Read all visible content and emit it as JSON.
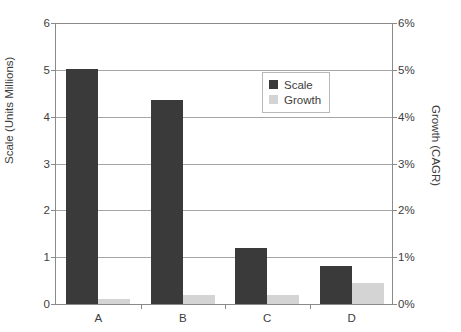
{
  "chart_data": {
    "type": "bar",
    "title": "",
    "subtitle": "",
    "xlabel": "",
    "ylabel": "Scale (Units Millions)",
    "y2label": "Growth (CAGR)",
    "categories": [
      "A",
      "B",
      "C",
      "D"
    ],
    "series": [
      {
        "name": "Scale",
        "axis": "left",
        "color": "#3a3a3a",
        "values": [
          5.0,
          4.35,
          1.2,
          0.8
        ]
      },
      {
        "name": "Growth",
        "axis": "right",
        "color": "#d4d4d4",
        "values": [
          0.1,
          0.2,
          0.2,
          0.45
        ]
      }
    ],
    "ylim": [
      0,
      6
    ],
    "y2lim": [
      0,
      6
    ],
    "yticks": [
      "0",
      "1",
      "2",
      "3",
      "4",
      "5",
      "6"
    ],
    "y2ticks": [
      "0%",
      "1%",
      "2%",
      "3%",
      "4%",
      "5%",
      "6%"
    ],
    "grid": "horizontal",
    "legend_position": "top-center-right",
    "legend": [
      "Scale",
      "Growth"
    ]
  },
  "colors": {
    "scale_bar": "#3a3a3a",
    "growth_bar": "#d4d4d4",
    "axis": "#8a8a8a",
    "gridline": "#a6a6a6",
    "text": "#3d3d3d",
    "background": "#ffffff"
  }
}
